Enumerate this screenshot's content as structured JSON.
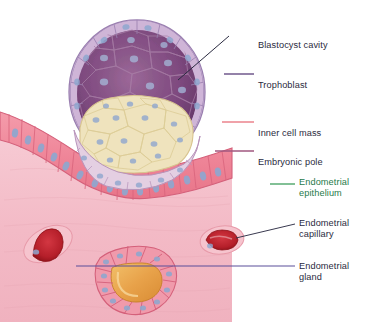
{
  "figure": {
    "background": "#ffffff"
  },
  "labels": [
    {
      "key": "blastocyst_cavity",
      "text": "Blastocyst cavity",
      "text_color": "#2a2a40",
      "leader_color": "#2a2a40",
      "x": 258,
      "y": 29,
      "leader": {
        "x1": 229,
        "y1": 36,
        "x2": 178,
        "y2": 80
      }
    },
    {
      "key": "trophoblast",
      "text": "Trophoblast",
      "text_color": "#2a2a40",
      "leader_color": "#5a3f7a",
      "x": 258,
      "y": 69,
      "leader": {
        "x1": 224,
        "y1": 74,
        "x2": 254,
        "y2": 74
      }
    },
    {
      "key": "inner_cell_mass",
      "text": "Inner cell mass",
      "text_color": "#2a2a40",
      "leader_color": "#e8707a",
      "x": 258,
      "y": 117,
      "leader": {
        "x1": 222,
        "y1": 122,
        "x2": 254,
        "y2": 122
      }
    },
    {
      "key": "embryonic_pole",
      "text": "Embryonic pole",
      "text_color": "#2a2a40",
      "leader_color": "#a0577f",
      "x": 258,
      "y": 146,
      "leader": {
        "x1": 215,
        "y1": 151,
        "x2": 254,
        "y2": 151
      }
    },
    {
      "key": "endometrial_epithelium",
      "text": "Endometrial\nepithelium",
      "text_color": "#1f7a4a",
      "leader_color": "#3f9e5e",
      "x": 299,
      "y": 177,
      "leader": {
        "x1": 270,
        "y1": 184,
        "x2": 295,
        "y2": 184
      }
    },
    {
      "key": "endometrial_capillary",
      "text": "Endometrial\ncapillary",
      "text_color": "#2a2a40",
      "leader_color": "#3a3a50",
      "x": 299,
      "y": 218,
      "leader": {
        "x1": 236,
        "y1": 238,
        "x2": 295,
        "y2": 224
      }
    },
    {
      "key": "endometrial_gland",
      "text": "Endometrial\ngland",
      "text_color": "#2a2a40",
      "leader_color": "#5b4f9a",
      "x": 299,
      "y": 261,
      "leader": {
        "x1": 76,
        "y1": 266,
        "x2": 295,
        "y2": 266
      }
    }
  ],
  "anatomy": {
    "blastocyst": {
      "name": "blastocyst",
      "cavity_color": "#7d4a7e",
      "cavity_color_dark": "#6b3a6d",
      "trophoblast_color": "#cfb6d8",
      "trophoblast_outline": "#9a7fb0",
      "inner_cell_mass_color": "#efe3bd",
      "inner_cell_mass_outline": "#d8c48f",
      "nucleus_color": "#8fa7cf",
      "center_x": 137,
      "center_y": 92,
      "radius_x": 68,
      "radius_y": 72
    },
    "endometrium": {
      "name": "endometrial-stroma",
      "stroma_color": "#f3b9c4",
      "stroma_color_light": "#f7cdd5",
      "epithelium_color": "#f08a9c",
      "epithelium_outline": "#d4607a",
      "epithelium_nucleus": "#8fa7cf",
      "capillary_wall": "#ef9aa9",
      "capillary_blood": "#b51f2a",
      "gland_lumen": "#e8a24a",
      "gland_cell": "#f09aab"
    }
  }
}
